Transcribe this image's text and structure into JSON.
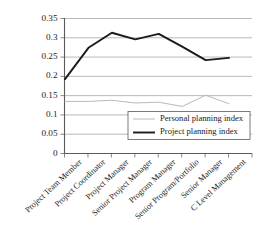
{
  "chart_data": {
    "type": "line",
    "title": "",
    "xlabel": "",
    "ylabel": "",
    "ylim": [
      0,
      0.35
    ],
    "yticks": [
      "0",
      "0.05",
      "0.1",
      "0.15",
      "0.2",
      "0.25",
      "0.3",
      "0.35"
    ],
    "ytick_values": [
      0,
      0.05,
      0.1,
      0.15,
      0.2,
      0.25,
      0.3,
      0.35
    ],
    "grid": true,
    "legend_position": "inside-lower-right",
    "categories": [
      "Project Team Member",
      "Project Coordinator",
      "Project Manager",
      "Senior Project Manager",
      "Program Manager",
      "Senior Program/Portfolio",
      "Senior Manager",
      "C Level Management"
    ],
    "series": [
      {
        "name": "Personal planning index",
        "color": "#b9b9b9",
        "width": 1.0,
        "values": [
          0.135,
          0.135,
          0.138,
          0.131,
          0.133,
          0.122,
          0.151,
          0.129
        ]
      },
      {
        "name": "Project planning index",
        "color": "#1a1a1a",
        "width": 1.9,
        "values": [
          0.193,
          0.274,
          0.313,
          0.296,
          0.31,
          0.277,
          0.242,
          0.248
        ]
      }
    ]
  },
  "legend": {
    "items": [
      {
        "label": "Personal planning index"
      },
      {
        "label": "Project planning index"
      }
    ]
  },
  "colors": {
    "personal": "#b9b9b9",
    "project": "#1a1a1a",
    "grid": "#9a9a9a",
    "axis": "#5a5a5a",
    "background": "#ffffff"
  }
}
